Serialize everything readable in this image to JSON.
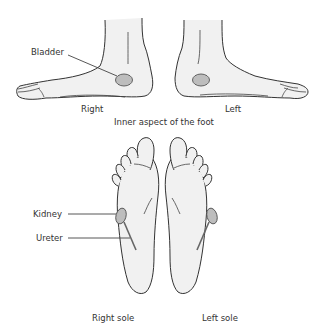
{
  "diagram": {
    "type": "anatomical-reflexology",
    "sections": [
      {
        "caption": "Inner aspect of the foot",
        "views": [
          {
            "label": "Right"
          },
          {
            "label": "Left"
          }
        ],
        "callouts": [
          {
            "label": "Bladder",
            "points_to": "bladder-reflex-area"
          }
        ]
      },
      {
        "views": [
          {
            "label": "Right sole"
          },
          {
            "label": "Left sole"
          }
        ],
        "callouts": [
          {
            "label": "Kidney",
            "points_to": "kidney-reflex-area"
          },
          {
            "label": "Ureter",
            "points_to": "ureter-reflex-line"
          }
        ]
      }
    ]
  },
  "labels": {
    "bladder": "Bladder",
    "right": "Right",
    "left": "Left",
    "inner_aspect": "Inner aspect of the foot",
    "kidney": "Kidney",
    "ureter": "Ureter",
    "right_sole": "Right sole",
    "left_sole": "Left sole"
  },
  "colors": {
    "foot_fill": "#f1f1f1",
    "outline": "#333333",
    "reflex_area": "#bdbdbd",
    "text": "#333333"
  }
}
